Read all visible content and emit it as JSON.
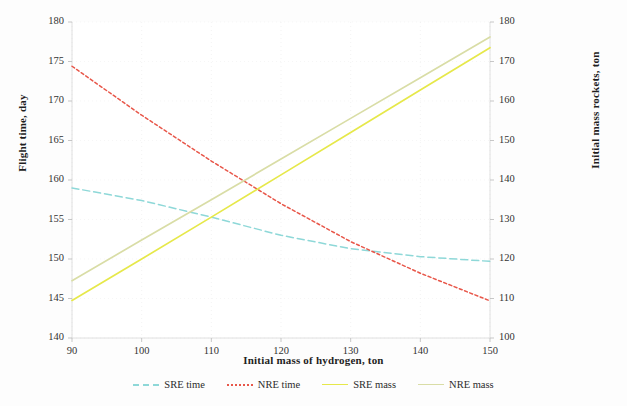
{
  "chart_data": {
    "type": "line",
    "title": "",
    "xlabel": "Initial mass of hydrogen, ton",
    "ylabel": "Flight time, day",
    "y2label": "Initial mass rockets, ton",
    "xlim": [
      90,
      150
    ],
    "ylim": [
      140,
      180
    ],
    "y2lim": [
      100,
      180
    ],
    "xticks": [
      90,
      100,
      110,
      120,
      130,
      140,
      150
    ],
    "yticks": [
      140,
      145,
      150,
      155,
      160,
      165,
      170,
      175,
      180
    ],
    "y2ticks": [
      100,
      110,
      120,
      130,
      140,
      150,
      160,
      170,
      180
    ],
    "grid": true,
    "legend_position": "bottom",
    "x": [
      90,
      100,
      110,
      120,
      130,
      140,
      150
    ],
    "series": [
      {
        "name": "SRE time",
        "axis": "left",
        "color": "#8ed8d8",
        "style": "dashed",
        "values": [
          159.0,
          157.4,
          155.3,
          153.0,
          151.3,
          150.3,
          149.7
        ]
      },
      {
        "name": "NRE time",
        "axis": "left",
        "color": "#e8574a",
        "style": "dotted",
        "values": [
          174.4,
          168.2,
          162.4,
          157.0,
          152.2,
          148.2,
          144.7
        ]
      },
      {
        "name": "SRE mass",
        "axis": "right",
        "color": "#e6e84a",
        "style": "solid",
        "values": [
          109.5,
          120.0,
          130.6,
          141.3,
          152.0,
          162.8,
          173.5
        ]
      },
      {
        "name": "NRE mass",
        "axis": "right",
        "color": "#d9dda6",
        "style": "solid",
        "values": [
          114.5,
          124.8,
          135.0,
          145.3,
          155.6,
          165.9,
          176.2
        ]
      }
    ]
  },
  "axes": {
    "left_title": "Flight time, day",
    "right_title": "Initial mass rockets, ton",
    "x_title": "Initial mass of hydrogen, ton"
  },
  "legend": {
    "items": [
      {
        "label": "SRE time",
        "color": "#8ed8d8",
        "style": "dashed"
      },
      {
        "label": "NRE time",
        "color": "#e8574a",
        "style": "dotted"
      },
      {
        "label": "SRE mass",
        "color": "#e6e84a",
        "style": "solid"
      },
      {
        "label": "NRE mass",
        "color": "#d9dda6",
        "style": "solid"
      }
    ]
  },
  "colors": {
    "background": "#fdfdfd",
    "grid": "#eaeaea",
    "axis": "#d8d8d8",
    "text": "#2b2b2b"
  }
}
